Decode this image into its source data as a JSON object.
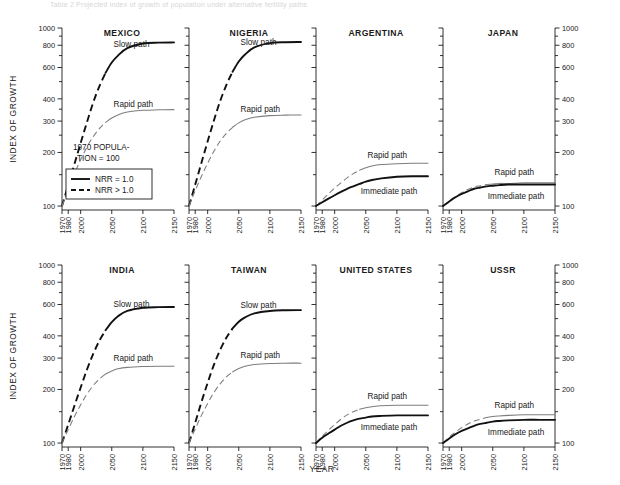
{
  "header": {
    "cropped_caption": "Table 2  Projected index of growth of population under alternative fertility paths"
  },
  "axes": {
    "y_title": "INDEX OF GROWTH",
    "x_title": "YEAR",
    "y_ticks": [
      100,
      200,
      300,
      400,
      600,
      800,
      1000
    ],
    "y_tick_labels": [
      "100",
      "200",
      "300",
      "400",
      "600",
      "800",
      "1000"
    ],
    "y_minor_ticks": [
      150,
      250,
      350,
      500,
      700,
      900
    ],
    "y_scale": "log",
    "ylim": [
      95,
      1000
    ],
    "x_ticks": [
      1970,
      1980,
      2000,
      2050,
      2100,
      2150
    ],
    "x_tick_labels": [
      "1970",
      "1980",
      "2000",
      "2050",
      "2100",
      "2150"
    ],
    "xlim": [
      1970,
      2150
    ]
  },
  "legend": {
    "annotation_line1": "1970 POPULA-",
    "annotation_line2": "TION = 100",
    "items": [
      {
        "label": "NRR  =  1.0",
        "style": "solid"
      },
      {
        "label": "NRR  >  1.0",
        "style": "dashed"
      }
    ]
  },
  "colors": {
    "dark_curve": "#111111",
    "gray_curve": "#7d7d7d",
    "axis": "#1a1a1a",
    "background": "#ffffff"
  },
  "chart_data": {
    "type": "line",
    "xlabel": "YEAR",
    "ylabel": "INDEX OF GROWTH",
    "ylim": [
      95,
      1000
    ],
    "yscale": "log",
    "xlim": [
      1970,
      2150
    ],
    "grid": false,
    "legend_position": "inside-panel-1-bottom-left",
    "x": [
      1970,
      1980,
      1990,
      2000,
      2010,
      2020,
      2030,
      2040,
      2050,
      2060,
      2075,
      2100,
      2125,
      2150
    ],
    "panels": [
      {
        "name": "MEXICO",
        "row": 0,
        "col": 0,
        "series": [
          {
            "name": "Slow path",
            "label_text": "Slow path",
            "style_segments": "dashed-until-NRR1-then-solid",
            "values": [
              100,
              131,
              172,
              226,
              295,
              380,
              470,
              560,
              640,
              700,
              770,
              818,
              828,
              830
            ]
          },
          {
            "name": "Rapid path",
            "label_text": "Rapid path",
            "style_segments": "dashed-until-NRR1-then-solid",
            "values": [
              100,
              124,
              152,
              182,
              214,
              245,
              272,
              295,
              312,
              325,
              337,
              345,
              347,
              348
            ]
          }
        ]
      },
      {
        "name": "NIGERIA",
        "row": 0,
        "col": 1,
        "series": [
          {
            "name": "Slow path",
            "label_text": "Slow path",
            "style_segments": "dashed-until-NRR1-then-solid",
            "values": [
              100,
              132,
              175,
              231,
              302,
              388,
              478,
              568,
              648,
              710,
              778,
              822,
              832,
              834
            ]
          },
          {
            "name": "Rapid path",
            "label_text": "Rapid path",
            "style_segments": "dashed-until-NRR1-then-solid",
            "values": [
              100,
              122,
              147,
              174,
              203,
              231,
              256,
              277,
              293,
              305,
              315,
              322,
              324,
              325
            ]
          }
        ]
      },
      {
        "name": "ARGENTINA",
        "row": 0,
        "col": 2,
        "series": [
          {
            "name": "Rapid path",
            "label_text": "Rapid path",
            "style_segments": "dashed-until-NRR1-then-solid",
            "values": [
              100,
              108,
              117,
              126,
              135,
              144,
              152,
              159,
              164,
              168,
              171,
              173,
              174,
              174
            ]
          },
          {
            "name": "Immediate path",
            "label_text": "Immediate path",
            "style_segments": "solid",
            "values": [
              100,
              105,
              110,
              115,
              120,
              125,
              129,
              133,
              137,
              140,
              143,
              146,
              147,
              147
            ]
          }
        ]
      },
      {
        "name": "JAPAN",
        "row": 0,
        "col": 3,
        "series": [
          {
            "name": "Rapid path",
            "label_text": "Rapid path",
            "style_segments": "dashed-until-NRR1-then-solid",
            "values": [
              100,
              107,
              113,
              119,
              124,
              128,
              130,
              132,
              133,
              134,
              134,
              135,
              135,
              135
            ]
          },
          {
            "name": "Immediate path",
            "label_text": "Immediate path",
            "style_segments": "solid",
            "values": [
              100,
              106,
              112,
              117,
              121,
              125,
              127,
              129,
              130,
              131,
              132,
              132,
              132,
              132
            ]
          }
        ]
      },
      {
        "name": "INDIA",
        "row": 1,
        "col": 0,
        "series": [
          {
            "name": "Slow path",
            "label_text": "Slow path",
            "style_segments": "dashed-until-NRR1-then-solid",
            "values": [
              100,
              127,
              162,
              205,
              258,
              316,
              375,
              430,
              478,
              516,
              552,
              575,
              580,
              581
            ]
          },
          {
            "name": "Rapid path",
            "label_text": "Rapid path",
            "style_segments": "dashed-until-NRR1-then-solid",
            "values": [
              100,
              119,
              141,
              164,
              188,
              210,
              229,
              244,
              254,
              261,
              266,
              269,
              270,
              270
            ]
          }
        ]
      },
      {
        "name": "TAIWAN",
        "row": 1,
        "col": 1,
        "series": [
          {
            "name": "Slow path",
            "label_text": "Slow path",
            "style_segments": "dashed-until-NRR1-then-solid",
            "values": [
              100,
              130,
              170,
              218,
              275,
              333,
              390,
              440,
              480,
              508,
              535,
              552,
              557,
              558
            ]
          },
          {
            "name": "Rapid path",
            "label_text": "Rapid path",
            "style_segments": "dashed-until-NRR1-then-solid",
            "values": [
              100,
              120,
              143,
              167,
              192,
              215,
              235,
              251,
              262,
              270,
              276,
              280,
              281,
              281
            ]
          }
        ]
      },
      {
        "name": "UNITED STATES",
        "row": 1,
        "col": 2,
        "series": [
          {
            "name": "Rapid path",
            "label_text": "Rapid path",
            "style_segments": "dashed-until-NRR1-then-solid",
            "values": [
              100,
              109,
              118,
              127,
              136,
              144,
              150,
              155,
              158,
              160,
              162,
              163,
              163,
              163
            ]
          },
          {
            "name": "Immediate path",
            "label_text": "Immediate path",
            "style_segments": "solid",
            "values": [
              100,
              107,
              113,
              119,
              125,
              130,
              134,
              137,
              139,
              141,
              142,
              143,
              143,
              143
            ]
          }
        ]
      },
      {
        "name": "USSR",
        "row": 1,
        "col": 3,
        "series": [
          {
            "name": "Rapid path",
            "label_text": "Rapid path",
            "style_segments": "dashed-until-NRR1-then-solid",
            "values": [
              100,
              108,
              115,
              122,
              128,
              133,
              136,
              139,
              141,
              142,
              143,
              144,
              144,
              144
            ]
          },
          {
            "name": "Immediate path",
            "label_text": "Immediate path",
            "style_segments": "solid",
            "values": [
              100,
              106,
              112,
              117,
              121,
              125,
              128,
              130,
              132,
              133,
              134,
              135,
              135,
              135
            ]
          }
        ]
      }
    ]
  }
}
